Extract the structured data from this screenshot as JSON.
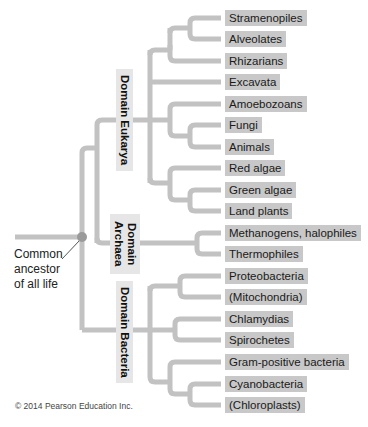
{
  "diagram": {
    "type": "phylogenetic-tree",
    "colors": {
      "branch": "#c2c2c2",
      "leaf_bg": "#c8c8c8",
      "domain_bg": "#e6e6e6",
      "node": "#9a9a9a"
    },
    "root_label": "Common ancestor of all life",
    "root_label_lines": [
      "Common",
      "ancestor",
      "of all life"
    ],
    "domains": [
      {
        "name": "Domain Eukarya",
        "lines": [
          "Domain Eukarya"
        ]
      },
      {
        "name": "Domain Archaea",
        "lines": [
          "Domain",
          "Archaea"
        ]
      },
      {
        "name": "Domain Bacteria",
        "lines": [
          "Domain Bacteria"
        ]
      }
    ],
    "leaves": [
      {
        "label": "Stramenopiles",
        "domain": "Eukarya"
      },
      {
        "label": "Alveolates",
        "domain": "Eukarya"
      },
      {
        "label": "Rhizarians",
        "domain": "Eukarya"
      },
      {
        "label": "Excavata",
        "domain": "Eukarya"
      },
      {
        "label": "Amoebozoans",
        "domain": "Eukarya"
      },
      {
        "label": "Fungi",
        "domain": "Eukarya"
      },
      {
        "label": "Animals",
        "domain": "Eukarya"
      },
      {
        "label": "Red algae",
        "domain": "Eukarya"
      },
      {
        "label": "Green algae",
        "domain": "Eukarya"
      },
      {
        "label": "Land plants",
        "domain": "Eukarya"
      },
      {
        "label": "Methanogens, halophiles",
        "domain": "Archaea"
      },
      {
        "label": "Thermophiles",
        "domain": "Archaea"
      },
      {
        "label": "Proteobacteria",
        "domain": "Bacteria"
      },
      {
        "label": "(Mitochondria)",
        "domain": "Bacteria"
      },
      {
        "label": "Chlamydias",
        "domain": "Bacteria"
      },
      {
        "label": "Spirochetes",
        "domain": "Bacteria"
      },
      {
        "label": "Gram-positive bacteria",
        "domain": "Bacteria"
      },
      {
        "label": "Cyanobacteria",
        "domain": "Bacteria"
      },
      {
        "label": "(Chloroplasts)",
        "domain": "Bacteria"
      }
    ],
    "copyright": "© 2014 Pearson Education Inc."
  }
}
